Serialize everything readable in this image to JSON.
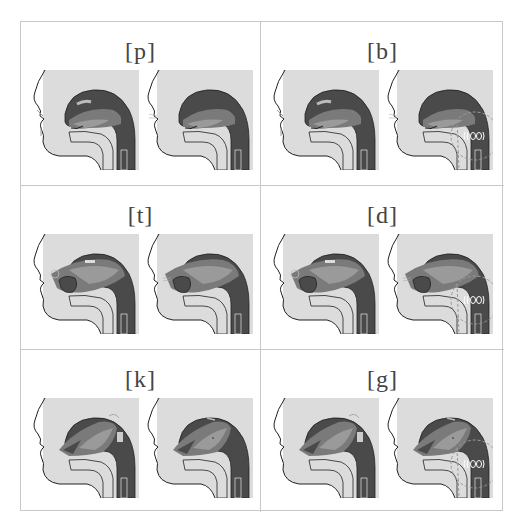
{
  "colors": {
    "background": "#ffffff",
    "border": "#c8c8c8",
    "label": "#444444",
    "skin": "#dcdcdc",
    "tract_dark": "#4a4a4a",
    "tongue_mid": "#7a7a7a",
    "tongue_light": "#9a9a9a",
    "outline": "#222222",
    "voicing_dash": "#9a9a9a"
  },
  "cells": [
    {
      "label": "[p]",
      "place": "bilabial",
      "voiced": false,
      "figures": [
        "closure",
        "release"
      ]
    },
    {
      "label": "[b]",
      "place": "bilabial",
      "voiced": true,
      "figures": [
        "closure",
        "release-voiced"
      ]
    },
    {
      "label": "[t]",
      "place": "alveolar",
      "voiced": false,
      "figures": [
        "closure",
        "release"
      ]
    },
    {
      "label": "[d]",
      "place": "alveolar",
      "voiced": true,
      "figures": [
        "closure",
        "release-voiced"
      ]
    },
    {
      "label": "[k]",
      "place": "velar",
      "voiced": false,
      "figures": [
        "closure",
        "release"
      ]
    },
    {
      "label": "[g]",
      "place": "velar",
      "voiced": true,
      "figures": [
        "closure",
        "release-voiced"
      ]
    }
  ],
  "icons": {
    "voicing": "vibration-circle-icon",
    "airflow": "arrow-icon"
  }
}
